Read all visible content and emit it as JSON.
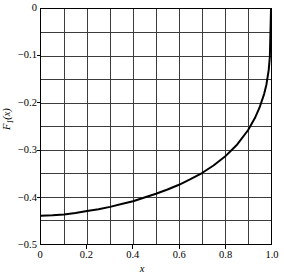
{
  "chart_data": {
    "type": "line",
    "title": "",
    "subtitle": "",
    "xlabel": "x",
    "ylabel": "F1(x)",
    "ylabel_base": "F",
    "ylabel_sub": "1",
    "ylabel_arg": "(x)",
    "xlim": [
      0,
      1.0
    ],
    "ylim": [
      -0.5,
      0.0
    ],
    "grid": true,
    "grid_x_step": 0.1,
    "grid_y_step": 0.05,
    "legend": "none",
    "x_ticks": [
      0,
      0.2,
      0.4,
      0.6,
      0.8,
      1.0
    ],
    "x_tick_labels": [
      "0",
      "0.2",
      "0.4",
      "0.6",
      "0.8",
      "1.0"
    ],
    "y_ticks": [
      0,
      -0.1,
      -0.2,
      -0.3,
      -0.4,
      -0.5
    ],
    "y_tick_labels": [
      "0",
      "−0.1",
      "−0.2",
      "−0.3",
      "−0.4",
      "−0.5"
    ],
    "series": [
      {
        "name": "F1(x)",
        "color": "#000000",
        "linewidth": 2.0,
        "x": [
          0.0,
          0.05,
          0.1,
          0.15,
          0.2,
          0.25,
          0.3,
          0.35,
          0.4,
          0.45,
          0.5,
          0.55,
          0.6,
          0.65,
          0.7,
          0.75,
          0.8,
          0.85,
          0.9,
          0.93,
          0.95,
          0.97,
          0.98,
          0.99,
          0.995,
          1.0
        ],
        "y": [
          -0.44,
          -0.439,
          -0.437,
          -0.434,
          -0.43,
          -0.426,
          -0.421,
          -0.415,
          -0.409,
          -0.401,
          -0.393,
          -0.384,
          -0.374,
          -0.362,
          -0.349,
          -0.333,
          -0.314,
          -0.29,
          -0.258,
          -0.232,
          -0.21,
          -0.181,
          -0.161,
          -0.13,
          -0.102,
          0.0
        ]
      }
    ]
  },
  "axes": {
    "x_axis_name": "x-axis",
    "y_axis_name": "y-axis"
  }
}
